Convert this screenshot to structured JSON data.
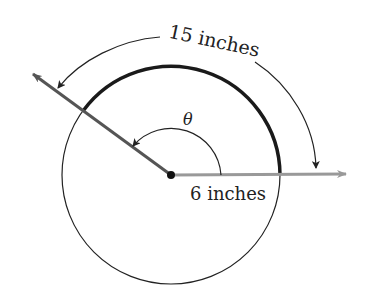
{
  "figure": {
    "arc_length_label": "15 inches",
    "radius_label": "6 inches",
    "angle_label": "θ",
    "arc_length_value": 15,
    "radius_value": 6,
    "units": "inches"
  },
  "colors": {
    "arc": "#1a1a1a",
    "terminal_ray": "#555555",
    "initial_ray": "#999999",
    "circle": "#222222",
    "arrows": "#222222"
  }
}
